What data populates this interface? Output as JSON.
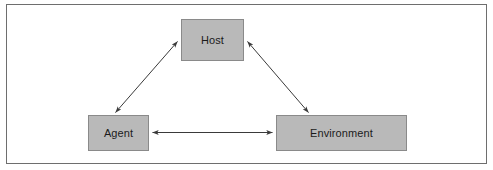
{
  "diagram": {
    "title": "",
    "frame": {
      "border_color": "#6e6e6e",
      "background_color": "#ffffff"
    },
    "node_style": {
      "fill_color": "#b9b9b9",
      "border_color": "#8a8a8a",
      "text_color": "#1b1b1b"
    },
    "edge_style": {
      "line_color": "#3a3a3a",
      "arrowhead": "filled-triangle",
      "direction": "bidirectional"
    },
    "nodes": [
      {
        "id": "host",
        "label": "Host",
        "position": "top-center"
      },
      {
        "id": "agent",
        "label": "Agent",
        "position": "bottom-left"
      },
      {
        "id": "environment",
        "label": "Environment",
        "position": "bottom-right"
      }
    ],
    "edges": [
      {
        "id": "agent-host",
        "from": "Agent",
        "to": "Host",
        "label": "",
        "bidirectional": true
      },
      {
        "id": "host-environment",
        "from": "Host",
        "to": "Environment",
        "label": "",
        "bidirectional": true
      },
      {
        "id": "agent-environment",
        "from": "Agent",
        "to": "Environment",
        "label": "",
        "bidirectional": true
      }
    ]
  }
}
